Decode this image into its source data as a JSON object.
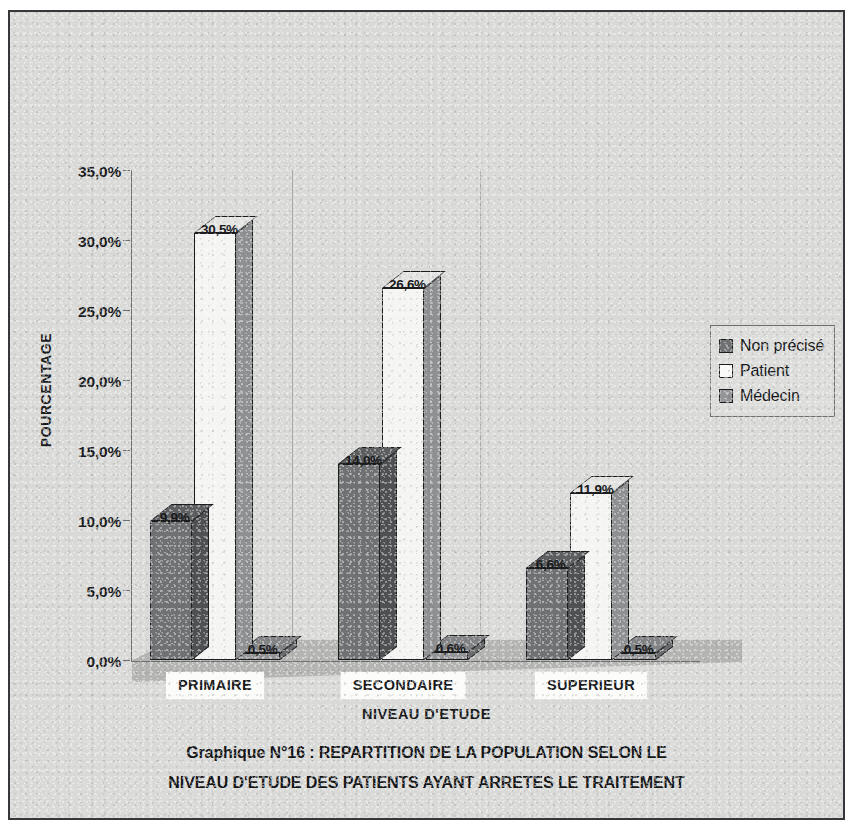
{
  "chart_data": {
    "type": "bar",
    "title": "Graphique N°16 : REPARTITION DE LA POPULATION SELON  LE NIVEAU D'ETUDE DES PATIENTS AYANT ARRETES LE TRAITEMENT",
    "title_line1": "Graphique N°16 : REPARTITION DE LA POPULATION SELON  LE",
    "title_line2": "NIVEAU D'ETUDE DES PATIENTS AYANT ARRETES LE TRAITEMENT",
    "xlabel": "NIVEAU D'ETUDE",
    "ylabel": "POURCENTAGE",
    "categories": [
      "PRIMAIRE",
      "SECONDAIRE",
      "SUPERIEUR"
    ],
    "ylim": [
      0,
      35
    ],
    "ytick_labels": [
      "0,0%",
      "5,0%",
      "10,0%",
      "15,0%",
      "20,0%",
      "25,0%",
      "30,0%",
      "35,0%"
    ],
    "ytick_values": [
      0,
      5,
      10,
      15,
      20,
      25,
      30,
      35
    ],
    "grid": false,
    "legend_position": "right",
    "series": [
      {
        "name": "Non précisé",
        "color": "#6f7173",
        "values": [
          9.9,
          14.0,
          6.6
        ],
        "labels": [
          "9,9%",
          "14,0%",
          "6,6%"
        ]
      },
      {
        "name": "Patient",
        "color": "#f4f4f2",
        "values": [
          30.5,
          26.6,
          11.9
        ],
        "labels": [
          "30,5%",
          "26,6%",
          "11,9%"
        ]
      },
      {
        "name": "Médecin",
        "color": "#949597",
        "values": [
          0.5,
          0.6,
          0.5
        ],
        "labels": [
          "0,5%",
          "0,6%",
          "0,5%"
        ]
      }
    ]
  }
}
